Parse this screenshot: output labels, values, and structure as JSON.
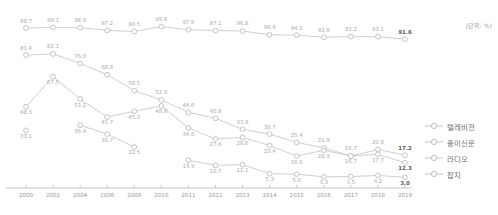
{
  "unit_note": "(단위: %)",
  "legend": {
    "items": [
      {
        "label": "텔레비전",
        "key": "television"
      },
      {
        "label": "종이신문",
        "key": "newspaper"
      },
      {
        "label": "라디오",
        "key": "radio"
      },
      {
        "label": "잡지",
        "key": "magazine"
      }
    ]
  },
  "chart_data": {
    "type": "line",
    "title": "",
    "subtitle": "",
    "xlabel": "",
    "ylabel": "",
    "unit": "%",
    "unit_note": "(단위: %)",
    "grid": false,
    "legend_position": "right",
    "ylim": [
      0,
      100
    ],
    "categories": [
      "2000",
      "2002",
      "2004",
      "2006",
      "2008",
      "2010",
      "2011",
      "2012",
      "2013",
      "2014",
      "2015",
      "2016",
      "2017",
      "2018",
      "2019"
    ],
    "series": [
      {
        "name": "텔레비전",
        "values": [
          98.7,
          99.1,
          98.9,
          97.2,
          96.5,
          99.6,
          97.6,
          97.1,
          96.8,
          94.4,
          94.1,
          92.8,
          93.2,
          93.1,
          91.6
        ],
        "labels": [
          "98.7",
          "99.1",
          "98.9",
          "97.2",
          "96.5",
          "99.6",
          "97.6",
          "97.1",
          "96.8",
          "94.4",
          "94.1",
          "92.8",
          "93.2",
          "93.1",
          "91.6"
        ],
        "emphasis_last": true
      },
      {
        "name": "라디오",
        "values": [
          81.4,
          82.1,
          76.0,
          68.8,
          58.5,
          52.6,
          44.6,
          40.8,
          33.8,
          30.7,
          25.4,
          21.9,
          16.7,
          20.8,
          17.2
        ],
        "labels": [
          "81.4",
          "82.1",
          "76.0",
          "68.8",
          "58.5",
          "52.6",
          "44.6",
          "40.8",
          "33.8",
          "30.7",
          "25.4",
          "21.9",
          "16.7",
          "20.8",
          "17.2"
        ],
        "emphasis_last": true
      },
      {
        "name": "종이신문",
        "values": [
          48.3,
          67.5,
          53.2,
          41.7,
          45.3,
          48.8,
          34.6,
          27.6,
          28.6,
          23.4,
          16.6,
          20.3,
          16.7,
          17.7,
          12.3
        ],
        "labels": [
          "48.3",
          "67.5",
          "53.2",
          "41.7",
          "45.3",
          "48.8",
          "34.6",
          "27.6",
          "28.6",
          "23.4",
          "16.6",
          "20.3",
          "16.7",
          "17.7",
          "12.3"
        ],
        "emphasis_last": true
      },
      {
        "name": "잡지",
        "values": [
          33.1,
          null,
          36.4,
          30.7,
          22.5,
          null,
          13.9,
          10.7,
          11.1,
          5.3,
          5.0,
          3.3,
          3.5,
          4.2,
          3.0
        ],
        "labels": [
          "33.1",
          "",
          "36.4",
          "30.7",
          "22.5",
          "",
          "13.9",
          "10.7",
          "11.1",
          "5.3",
          "5.0",
          "3.3",
          "3.5",
          "4.2",
          "3.0"
        ],
        "emphasis_last": true
      }
    ]
  }
}
